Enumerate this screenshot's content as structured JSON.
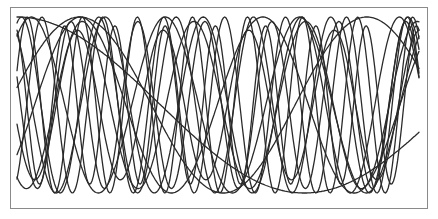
{
  "chart_data": {
    "type": "line",
    "title": "",
    "xlabel": "",
    "ylabel": "",
    "grid": false,
    "legend": null,
    "axes_visible": false,
    "xlim": [
      0,
      1
    ],
    "ylim": [
      -1,
      1
    ],
    "series": [
      {
        "name": "s1",
        "frequency": 0.7,
        "phase": 1.57,
        "amplitude": 1.0
      },
      {
        "name": "s2",
        "frequency": 3.0,
        "phase": 0.9,
        "amplitude": 1.0
      },
      {
        "name": "s3",
        "frequency": 4.1,
        "phase": 2.2,
        "amplitude": 1.0
      },
      {
        "name": "s4",
        "frequency": 5.2,
        "phase": 1.2,
        "amplitude": 1.0
      },
      {
        "name": "s5",
        "frequency": 6.0,
        "phase": 2.8,
        "amplitude": 0.95
      },
      {
        "name": "s6",
        "frequency": 7.3,
        "phase": 0.4,
        "amplitude": 1.0
      },
      {
        "name": "s7",
        "frequency": 8.0,
        "phase": 1.9,
        "amplitude": 0.9
      },
      {
        "name": "s8",
        "frequency": 2.2,
        "phase": -0.6,
        "amplitude": 1.0
      },
      {
        "name": "s9",
        "frequency": 1.4,
        "phase": 0.2,
        "amplitude": 1.0
      },
      {
        "name": "s10",
        "frequency": 6.6,
        "phase": -1.0,
        "amplitude": 1.0
      },
      {
        "name": "s11",
        "frequency": 4.7,
        "phase": 3.4,
        "amplitude": 0.85
      },
      {
        "name": "s12",
        "frequency": 3.6,
        "phase": -2.1,
        "amplitude": 0.95
      }
    ]
  },
  "style": {
    "line_color": "#2a2a2a",
    "frame_color": "#8a8a8a",
    "background": "#ffffff"
  },
  "plot_area": {
    "x0": 6,
    "x1": 408,
    "y_top": 9,
    "y_bottom": 185
  }
}
